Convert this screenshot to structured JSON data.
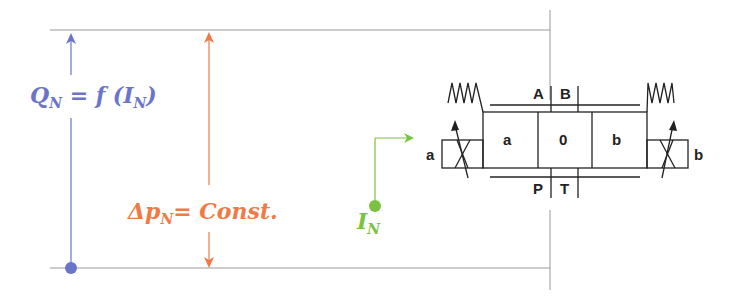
{
  "labels": {
    "flow": {
      "main": "Q",
      "sub": "N",
      "rest": " = f (I",
      "sub2": "N",
      "close": ")"
    },
    "pressure": {
      "main": "Δp",
      "sub": "N",
      "rest": "= Const."
    },
    "current": {
      "main": "I",
      "sub": "N"
    }
  },
  "valve": {
    "ports_top": [
      "A",
      "B"
    ],
    "ports_bottom": [
      "P",
      "T"
    ],
    "positions": [
      "a",
      "0",
      "b"
    ],
    "solenoid_left": "a",
    "solenoid_right": "b"
  },
  "colors": {
    "flow": "#6b74c8",
    "pressure": "#f07a45",
    "current": "#7cc242",
    "line": "#888888",
    "symbol": "#222222"
  }
}
